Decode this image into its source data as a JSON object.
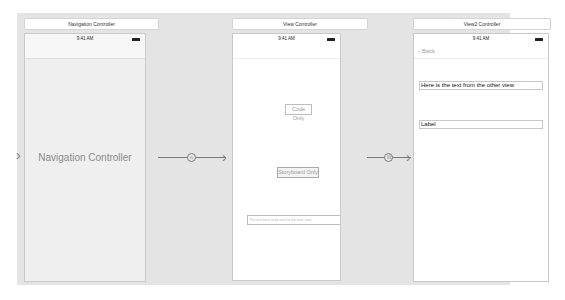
{
  "scenes": [
    {
      "title": "Navigation Controller",
      "status_time": "9:41 AM",
      "center_label": "Navigation Controller"
    },
    {
      "title": "View Controller",
      "status_time": "9:41 AM",
      "code_only_button": "Code Only",
      "storyboard_only_button": "Storyboard Only",
      "text_field_placeholder": "Put text here to be sent to the next view"
    },
    {
      "title": "View2 Controller",
      "status_time": "9:41 AM",
      "back_button": "Back",
      "text_label": "Here is the text from the other view",
      "label": "Label"
    }
  ],
  "segues": [
    {
      "type": "relationship",
      "icon": "relationship-segue-icon",
      "glyph": "⦸"
    },
    {
      "type": "show",
      "icon": "show-segue-icon",
      "glyph": "⊡"
    }
  ],
  "icons": {
    "entry_arrow": "›",
    "arrow_head": "›",
    "back_chevron": "‹"
  }
}
